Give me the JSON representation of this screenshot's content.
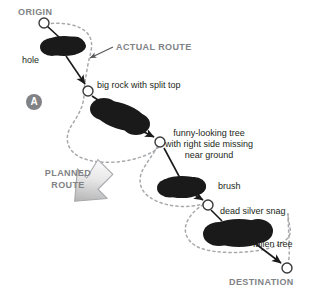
{
  "diagram": {
    "title_labels": {
      "origin": "ORIGIN",
      "destination": "DESTINATION",
      "actual_route": "ACTUAL ROUTE",
      "planned_route_line1": "PLANNED",
      "planned_route_line2": "ROUTE"
    },
    "panel_badge": "A",
    "features": [
      {
        "id": "hole",
        "label": "hole"
      },
      {
        "id": "big-rock",
        "label": "big rock with split top"
      },
      {
        "id": "funny-tree-l1",
        "label": "funny-looking tree"
      },
      {
        "id": "funny-tree-l2",
        "label": "with right side missing"
      },
      {
        "id": "funny-tree-l3",
        "label": "near ground"
      },
      {
        "id": "brush",
        "label": "brush"
      },
      {
        "id": "dead-silver-snag",
        "label": "dead silver snag"
      },
      {
        "id": "fallen-tree",
        "label": "fallen tree"
      }
    ],
    "colors": {
      "obstacle_fill": "#1a1a1a",
      "heading_text": "#808285",
      "feature_text": "#231f20",
      "dotted_route": "#a7a9ac",
      "planned_arrow_stroke": "#a7a9ac",
      "background": "#ffffff",
      "badge_fill": "#808285"
    }
  }
}
